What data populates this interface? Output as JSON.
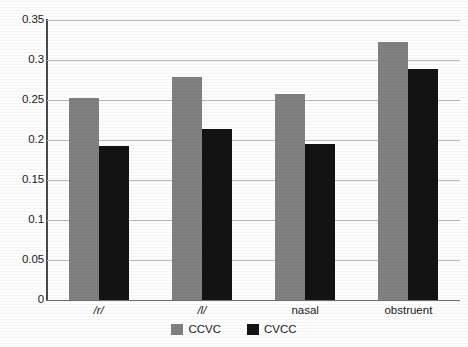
{
  "chart_data": {
    "type": "bar",
    "title": "",
    "subtitle": "",
    "xlabel": "",
    "ylabel": "",
    "categories": [
      "/r/",
      "/l/",
      "nasal",
      "obstruent"
    ],
    "category_styles": [
      "italic",
      "italic",
      "normal",
      "normal"
    ],
    "series": [
      {
        "name": "CCVC",
        "color": "#808080",
        "values": [
          0.253,
          0.279,
          0.257,
          0.322
        ]
      },
      {
        "name": "CVCC",
        "color": "#131313",
        "values": [
          0.192,
          0.214,
          0.195,
          0.289
        ]
      }
    ],
    "ylim": [
      0,
      0.35
    ],
    "ytick_values": [
      0,
      0.05,
      0.1,
      0.15,
      0.2,
      0.25,
      0.3,
      0.35
    ],
    "ytick_labels": [
      "0",
      "0.05",
      "0.1",
      "0.15",
      "0.2",
      "0.25",
      "0.3",
      "0.35"
    ],
    "grid": true,
    "grid_axis": "y",
    "legend": true,
    "legend_position": "bottom",
    "colors": {
      "series_ccvc": "#808080",
      "series_cvcc": "#131313",
      "gridline": "#b9b9b9",
      "axis": "#4a4a4a",
      "text": "#1a1a1a",
      "background": "#fdfdfd"
    }
  },
  "legend": {
    "items": [
      {
        "label": "CCVC",
        "series": "series-ccvc"
      },
      {
        "label": "CVCC",
        "series": "series-cvcc"
      }
    ]
  }
}
